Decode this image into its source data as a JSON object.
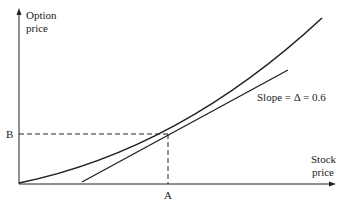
{
  "diagram": {
    "y_axis_label_line1": "Option",
    "y_axis_label_line2": "price",
    "x_axis_label_line1": "Stock",
    "x_axis_label_line2": "price",
    "slope_label": "Slope = Δ = 0.6",
    "point_b": "B",
    "point_a": "A",
    "delta": 0.6
  }
}
